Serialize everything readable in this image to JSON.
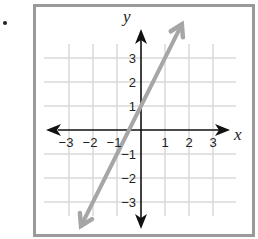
{
  "bullet": "•",
  "chart_data": {
    "type": "line",
    "title": "",
    "xlabel": "x",
    "ylabel": "y",
    "xlim": [
      -4,
      4
    ],
    "ylim": [
      -4,
      4
    ],
    "grid": true,
    "x_ticks": [
      -3,
      -2,
      -1,
      1,
      2,
      3
    ],
    "y_ticks": [
      -3,
      -2,
      -1,
      1,
      2,
      3
    ],
    "x_tick_labels": [
      "−3",
      "−2",
      "−1",
      "1",
      "2",
      "3"
    ],
    "y_tick_labels": [
      "−3",
      "−2",
      "−1",
      "1",
      "2",
      "3"
    ],
    "series": [
      {
        "name": "line",
        "equation": "y = 2x + 1",
        "x": [
          -2.5,
          1.7
        ],
        "y": [
          -4.0,
          4.4
        ],
        "arrows_both_ends": true,
        "color": "#a6a6a6"
      }
    ],
    "colors": {
      "axes": "#111111",
      "grid": "#d9d9d9",
      "frame": "#9a9a9a",
      "line": "#a6a6a6"
    }
  }
}
